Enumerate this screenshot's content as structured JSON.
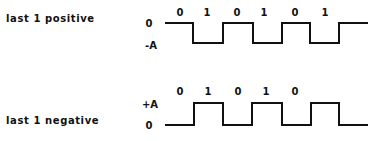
{
  "diagrams": [
    {
      "title": "last 1 positive",
      "levels": {
        "high": "0",
        "low": "-A"
      },
      "bits": [
        "0",
        "1",
        "0",
        "1",
        "0",
        "1"
      ],
      "waveform_points": "165,23 193,23 193,43 223,43 223,23 253,23 253,43 282,43 282,23 310,23 310,43 339,43 339,23 368,23"
    },
    {
      "title": "last 1 negative",
      "levels": {
        "high": "+A",
        "low": "0"
      },
      "bits": [
        "0",
        "1",
        "0",
        "1",
        "0"
      ],
      "waveform_points": "165,125 194,125 194,103 223,103 223,125 252,125 252,103 282,103 282,125 311,125 311,103 339,103 339,125 368,125"
    }
  ],
  "colors": {
    "line": "#111111",
    "background": "#ffffff"
  }
}
